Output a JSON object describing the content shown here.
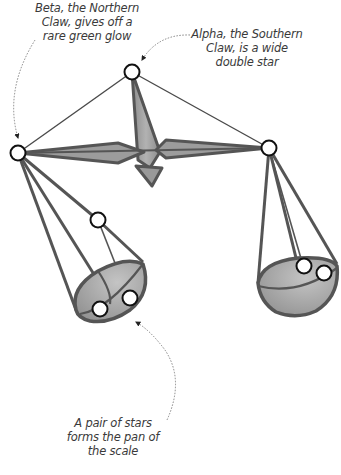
{
  "diagram": {
    "colors": {
      "fill": "#9a9a9a",
      "fill_light": "#b8b8b8",
      "stroke": "#555555",
      "line": "#4a4a4a",
      "star_fill": "#ffffff",
      "star_stroke": "#111111",
      "text": "#3a3a3a",
      "arrow": "#777777"
    },
    "annotations": {
      "beta": {
        "lines": [
          "Beta, the Northern",
          "Claw, gives off a",
          "rare green glow"
        ]
      },
      "alpha": {
        "lines": [
          "Alpha, the Southern",
          "Claw, is a wide",
          "double star"
        ]
      },
      "pan": {
        "lines": [
          "A pair of stars",
          "forms the pan of",
          "the scale"
        ]
      }
    },
    "stars": [
      {
        "name": "top-star",
        "x": 132,
        "y": 72
      },
      {
        "name": "beta-star",
        "x": 18,
        "y": 153
      },
      {
        "name": "alpha-star",
        "x": 269,
        "y": 148
      },
      {
        "name": "left-mid-star",
        "x": 98,
        "y": 220
      },
      {
        "name": "left-pan-star-1",
        "x": 100,
        "y": 309
      },
      {
        "name": "left-pan-star-2",
        "x": 130,
        "y": 298
      },
      {
        "name": "right-pan-star-1",
        "x": 304,
        "y": 266
      },
      {
        "name": "right-pan-star-2",
        "x": 324,
        "y": 273
      }
    ]
  }
}
